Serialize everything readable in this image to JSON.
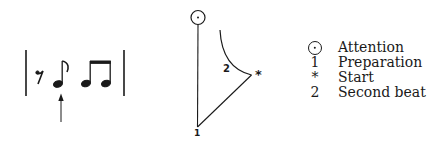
{
  "notation": {
    "description": "Measure: eighth rest, eighth note (with arrow), two beamed eighth notes",
    "elements": [
      "barline",
      "eighth-rest",
      "eighth-note",
      "beamed-eighth-pair",
      "barline"
    ],
    "arrow_target": "eighth-note"
  },
  "diagram": {
    "labels": {
      "second_beat": "2",
      "start": "*",
      "preparation": "1"
    }
  },
  "legend": {
    "items": [
      {
        "symbol": "circle-dot",
        "label": "Attention"
      },
      {
        "symbol": "1",
        "label": "Preparation"
      },
      {
        "symbol": "*",
        "label": "Start"
      },
      {
        "symbol": "2",
        "label": "Second beat"
      }
    ]
  }
}
